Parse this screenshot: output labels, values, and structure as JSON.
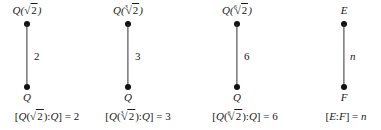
{
  "columns": [
    {
      "top": {
        "field": "Q",
        "index": "",
        "radicand": "2"
      },
      "bottom": "Q",
      "degree": "2",
      "caption": {
        "field": "Q",
        "index": "",
        "radicand": "2",
        "base": "Q",
        "value": "2"
      }
    },
    {
      "top": {
        "field": "Q",
        "index": "3",
        "radicand": "2"
      },
      "bottom": "Q",
      "degree": "3",
      "caption": {
        "field": "Q",
        "index": "3",
        "radicand": "2",
        "base": "Q",
        "value": "3"
      }
    },
    {
      "top": {
        "field": "Q",
        "index": "6",
        "radicand": "2"
      },
      "bottom": "Q",
      "degree": "6",
      "caption": {
        "field": "Q",
        "index": "6",
        "radicand": "2",
        "base": "Q",
        "value": "6"
      }
    },
    {
      "top_plain": "E",
      "bottom": "F",
      "degree": "n",
      "caption_plain": {
        "top": "E",
        "base": "F",
        "value": "n"
      }
    }
  ]
}
